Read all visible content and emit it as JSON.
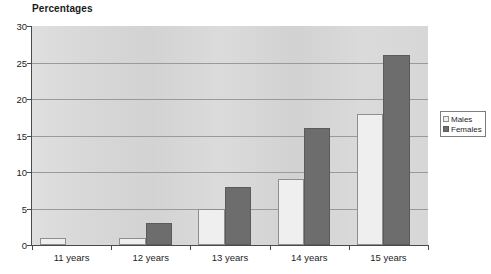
{
  "chart_data": {
    "type": "bar",
    "title": "Percentages",
    "xlabel": "",
    "ylabel": "",
    "categories": [
      "11 years",
      "12 years",
      "13 years",
      "14 years",
      "15 years"
    ],
    "series": [
      {
        "name": "Males",
        "values": [
          1,
          1,
          5,
          9,
          18
        ],
        "color": "#efefef"
      },
      {
        "name": "Females",
        "values": [
          0,
          3,
          8,
          16,
          26
        ],
        "color": "#6d6d6d"
      }
    ],
    "ylim": [
      0,
      30
    ],
    "yticks": [
      0,
      5,
      10,
      15,
      20,
      25,
      30
    ],
    "ytick_labels": [
      "0",
      "5",
      "10",
      "15",
      "20",
      "25",
      "30"
    ],
    "grid": true,
    "grid_axis": "y",
    "legend_position": "right",
    "plot_background": "#d6d6d6",
    "axis_color": "#4a4a4a",
    "gridline_color": "#9a9a9a"
  },
  "legend": {
    "entries": [
      {
        "label": "Males"
      },
      {
        "label": "Females"
      }
    ]
  }
}
